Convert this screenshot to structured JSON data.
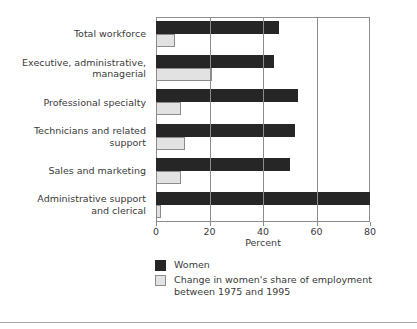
{
  "chart_data": {
    "type": "bar",
    "orientation": "horizontal",
    "title": "",
    "xlabel": "Percent",
    "ylabel": "",
    "xlim": [
      0,
      80
    ],
    "xticks": [
      0,
      20,
      40,
      60,
      80
    ],
    "xtick_labels": [
      "0",
      "20",
      "40",
      "60",
      "80"
    ],
    "grid": true,
    "legend_position": "below",
    "categories": [
      "Total workforce",
      "Executive, administrative,\nmanagerial",
      "Professional specialty",
      "Technicians and related\nsupport",
      "Sales and marketing",
      "Administrative support\nand clerical"
    ],
    "series": [
      {
        "name": "Women",
        "color": "#262626",
        "values": [
          46,
          44,
          53,
          52,
          50,
          80
        ]
      },
      {
        "name": "Change in women's share of employment\nbetween 1975 and 1995",
        "color": "#e2e2e2",
        "values": [
          7,
          21,
          9.5,
          11,
          9.5,
          2
        ]
      }
    ]
  },
  "axis": {
    "xlabel": "Percent",
    "ticks": [
      {
        "value": 0,
        "label": "0"
      },
      {
        "value": 20,
        "label": "20"
      },
      {
        "value": 40,
        "label": "40"
      },
      {
        "value": 60,
        "label": "60"
      },
      {
        "value": 80,
        "label": "80"
      }
    ]
  },
  "legend": {
    "items": [
      {
        "label": "Women",
        "color": "#262626"
      },
      {
        "label": "Change in women's share of employment\nbetween 1975 and 1995",
        "color": "#e2e2e2"
      }
    ]
  },
  "colors": {
    "women_bar": "#262626",
    "change_bar": "#e2e2e2",
    "frame": "#8c8c8c",
    "text": "#3a3a3a",
    "background": "#ffffff"
  }
}
